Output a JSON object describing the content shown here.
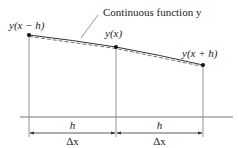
{
  "diagram": {
    "callout_label": "Continuous function y",
    "points": [
      {
        "label": "y(x − h)",
        "x": 29,
        "y": 35
      },
      {
        "label": "y(x)",
        "x": 116,
        "y": 47
      },
      {
        "label": "y(x + h)",
        "x": 203,
        "y": 65
      }
    ],
    "spans": [
      {
        "top_label": "h",
        "bottom_label": "Δx"
      },
      {
        "top_label": "h",
        "bottom_label": "Δx"
      }
    ],
    "colors": {
      "line": "#333333",
      "curve": "#555555",
      "axis": "#777777",
      "text": "#222222"
    }
  }
}
